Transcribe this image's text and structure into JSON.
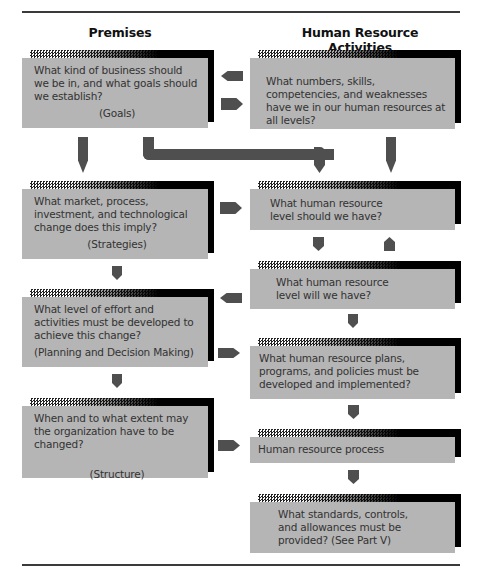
{
  "columns": {
    "left_title": "Premises",
    "right_title": "Human Resource Activities"
  },
  "left_boxes": [
    {
      "text": "What kind of business should we be in, and what goals should we establish?",
      "label": "(Goals)"
    },
    {
      "text": "What market, process, investment, and technological change does this imply?",
      "label": "(Strategies)"
    },
    {
      "text": "What level of effort and activities must be developed to achieve this change?",
      "label": "(Planning and Decision Making)"
    },
    {
      "text": "When and to what extent may the organization have to be changed?",
      "label": "(Structure)"
    }
  ],
  "right_boxes": [
    {
      "text": "What numbers, skills, competencies, and weaknesses have we in our human resources at all levels?"
    },
    {
      "text": "What human resource level should we have?"
    },
    {
      "text": "What human resource level will we have?"
    },
    {
      "text": "What human resource plans, programs, and policies must be developed and implemented?"
    },
    {
      "text": "Human resource process"
    },
    {
      "text": "What standards, controls, and allowances must be provided? (See Part V)"
    }
  ],
  "colors": {
    "box_fill": "#b5b5b5",
    "arrow": "#4f4f4f",
    "shadow": "#000000"
  }
}
